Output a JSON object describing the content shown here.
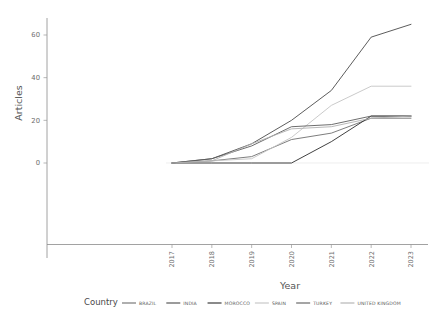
{
  "chart_data": {
    "type": "line",
    "title": "",
    "xlabel": "Year",
    "ylabel": "Articles",
    "x": [
      2017,
      2018,
      2019,
      2020,
      2021,
      2022,
      2023
    ],
    "xtick_labels": [
      "2017",
      "2018",
      "2019",
      "2020",
      "2021",
      "2022",
      "2023"
    ],
    "ytick_labels": [
      "0",
      "20",
      "40",
      "60"
    ],
    "ytick_values": [
      0,
      20,
      40,
      60
    ],
    "ylim": [
      0,
      68
    ],
    "xlim": [
      2016.6,
      2023.4
    ],
    "grid": false,
    "legend_position": "bottom",
    "legend_title": "Country",
    "series": [
      {
        "name": "BRAZIL",
        "color": "#6e6e6e",
        "values": [
          0,
          1,
          3,
          11,
          14,
          21,
          21
        ]
      },
      {
        "name": "INDIA",
        "color": "#4a4a4a",
        "values": [
          0,
          2,
          9,
          20,
          34,
          59,
          65
        ]
      },
      {
        "name": "MOROCCO",
        "color": "#2b2b2b",
        "values": [
          0,
          0,
          0,
          0,
          10,
          22,
          22
        ]
      },
      {
        "name": "SPAIN",
        "color": "#c4c4c4",
        "values": [
          0,
          1,
          2,
          12,
          27,
          36,
          36
        ]
      },
      {
        "name": "TURKEY",
        "color": "#5c5c5c",
        "values": [
          0,
          2,
          8,
          17,
          18,
          22,
          22
        ]
      },
      {
        "name": "UNITED KINGDOM",
        "color": "#b0b0b0",
        "values": [
          0,
          1,
          9,
          16,
          17,
          21,
          22
        ]
      }
    ]
  },
  "axes": {
    "y_title": "Articles",
    "x_title": "Year"
  },
  "legend": {
    "title": "Country",
    "items": [
      {
        "label": "BRAZIL"
      },
      {
        "label": "INDIA"
      },
      {
        "label": "MOROCCO"
      },
      {
        "label": "SPAIN"
      },
      {
        "label": "TURKEY"
      },
      {
        "label": "UNITED KINGDOM"
      }
    ]
  }
}
